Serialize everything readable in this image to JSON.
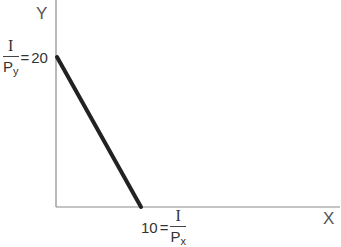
{
  "diagram": {
    "axes": {
      "y_label": "Y",
      "x_label": "X"
    },
    "y_intercept": {
      "numerator": "I",
      "denominator_base": "P",
      "denominator_sub": "y",
      "equals": "=",
      "value": "20"
    },
    "x_intercept": {
      "value": "10",
      "equals": "=",
      "numerator": "I",
      "denominator_base": "P",
      "denominator_sub": "x"
    },
    "colors": {
      "axis": "#8a8a8a",
      "budget_line": "#222222"
    }
  }
}
